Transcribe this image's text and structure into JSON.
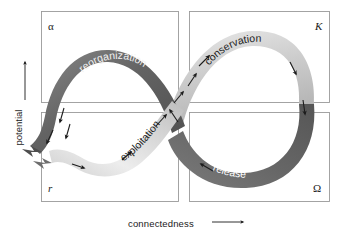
{
  "figure": {
    "axes": {
      "y": {
        "label": "potential",
        "arrow_icon": "arrow-up-icon",
        "direction": "up"
      },
      "x": {
        "label": "connectedness",
        "arrow_icon": "arrow-right-icon",
        "direction": "right"
      }
    },
    "quadrants": [
      {
        "id": "alpha",
        "symbol": "α",
        "position": "top-left",
        "phase": "reorganization"
      },
      {
        "id": "K",
        "symbol": "K",
        "position": "top-right",
        "phase": "conservation"
      },
      {
        "id": "r",
        "symbol": "r",
        "position": "bottom-left",
        "phase": "exploitation"
      },
      {
        "id": "omega",
        "symbol": "Ω",
        "position": "bottom-right",
        "phase": "release"
      }
    ],
    "phases": [
      {
        "id": "reorganization",
        "label": "reorganization",
        "band_color": "#6e6e6e",
        "text_color": "#f2f2f2"
      },
      {
        "id": "exploitation",
        "label": "exploitation",
        "band_color": "#d9d9d9",
        "text_color": "#1a1a1a"
      },
      {
        "id": "conservation",
        "label": "conservation",
        "band_color": "#c9c9c9",
        "text_color": "#1a1a1a"
      },
      {
        "id": "release",
        "label": "release",
        "band_color": "#6a6a6a",
        "text_color": "#ffffff"
      }
    ],
    "colors": {
      "frame_stroke": "#9a9a9a",
      "band_dark": "#5f5f5f",
      "band_light": "#e6e6e6",
      "arrow": "#1c1c1c",
      "background": "#ffffff",
      "text": "#1a1a1a"
    },
    "exit_arrows": {
      "count": 2,
      "icon": "arrow-left-icon",
      "description": "two arrows exiting left"
    }
  }
}
